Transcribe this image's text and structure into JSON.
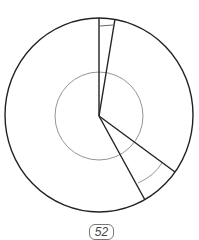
{
  "diagram": {
    "type": "circle-with-wedges",
    "center": [
      99,
      116
    ],
    "outer_radius": [
      94,
      97
    ],
    "inner_radius": 44,
    "wedges": [
      {
        "name": "top-narrow-wedge",
        "from_point": [
          99,
          18
        ],
        "to_point": [
          114,
          19
        ],
        "inner_arc_radius": 89
      },
      {
        "name": "lower-right-wedge",
        "from_point": [
          175,
          172
        ],
        "to_point": [
          145,
          200
        ],
        "inner_arc_radius": 75
      }
    ],
    "stroke_color": "#222222",
    "thin_stroke_color": "#888888"
  },
  "page": {
    "number_label": "52"
  }
}
